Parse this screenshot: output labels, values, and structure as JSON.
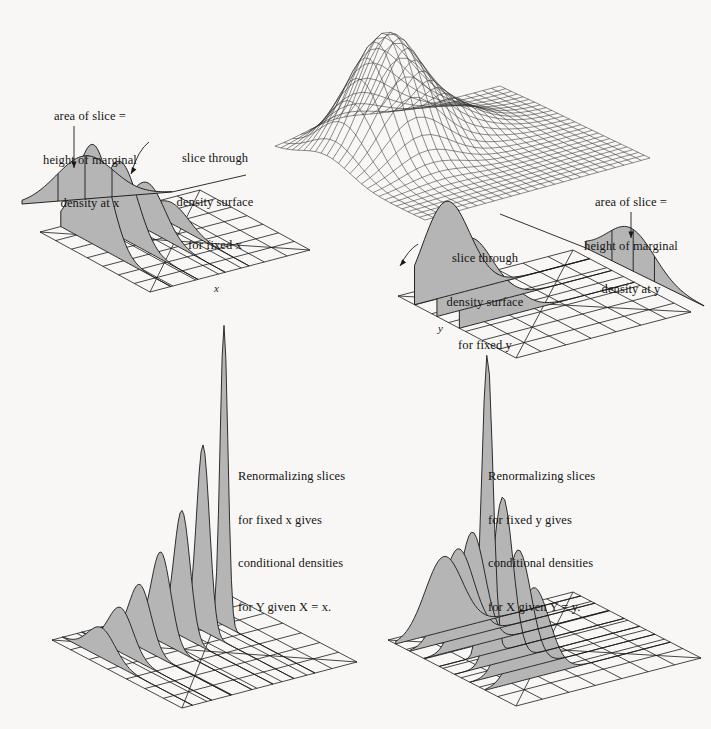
{
  "figure": {
    "background_color": "#f8f7f5",
    "ink_color": "#1a1a1a",
    "slice_fill_color": "#b5b5b5",
    "mesh_color": "#303030"
  },
  "annotations": {
    "top_left_marginal": {
      "line1": "area of slice =",
      "line2": "height of marginal",
      "line3": "density at x"
    },
    "top_left_slice": {
      "line1": "slice through",
      "line2": "density surface",
      "line3": "for fixed x"
    },
    "mid_right_slice": {
      "line1": "slice through",
      "line2": "density surface",
      "line3": "for fixed y"
    },
    "mid_right_marginal": {
      "line1": "area of slice =",
      "line2": "height of marginal",
      "line3": "density at y"
    },
    "bottom_left": {
      "line1": "Renormalizing slices",
      "line2": "for fixed x gives",
      "line3": "conditional densities",
      "line4": "for Y given X = x."
    },
    "bottom_right": {
      "line1": "Renormalizing slices",
      "line2": "for fixed y gives",
      "line3": "conditional densities",
      "line4": "for X given Y = y."
    }
  },
  "axis_labels": {
    "x": "x",
    "y": "y"
  },
  "chart_data": {
    "type": "surface",
    "xlabel": "x",
    "ylabel": "y",
    "grid": true,
    "legend": "none",
    "panels": [
      {
        "id": "top-surface",
        "kind": "wireframe-mesh",
        "description": "Bivariate probability density surface drawn as a wireframe mesh on a flat base plane; single dominant mode in the near-left quadrant decaying to zero at the edges.",
        "mesh_rows": 28,
        "mesh_cols": 28,
        "peak_height_rel": 1.0,
        "peak_location": [
          0.3,
          0.35
        ]
      },
      {
        "id": "top-left-slices",
        "kind": "slices-fixed-x",
        "description": "Density surface cut into slices at fixed x; shaded slice profiles over a 7x7 grid floor, plus an elevated marginal density curve whose area equals the marginal height.",
        "grid_rows": 7,
        "grid_cols": 7,
        "slice_count": 4,
        "slice_peak_heights": [
          0.95,
          0.72,
          0.45,
          0.2
        ],
        "marginal_inset": {
          "tick_count": 3,
          "shape": "unimodal"
        }
      },
      {
        "id": "mid-right-slices",
        "kind": "slices-fixed-y",
        "description": "Density surface cut into slices at fixed y; shaded nested slice profiles over a 7x7 grid floor.",
        "grid_rows": 7,
        "grid_cols": 7,
        "slice_count": 3,
        "slice_peak_heights": [
          0.95,
          0.7,
          0.45
        ],
        "marginal_inset": {
          "tick_count": 3,
          "shape": "unimodal",
          "tilted": true
        }
      },
      {
        "id": "bottom-left-conditionals",
        "kind": "conditional-densities-given-x",
        "description": "Renormalized slices for fixed x: seven conditional density curves of Y given X = x, heights increasing steeply toward the back-right, the last one a very tall narrow spike.",
        "grid_rows": 7,
        "grid_cols": 7,
        "slice_count": 7,
        "slice_peak_heights": [
          0.1,
          0.15,
          0.21,
          0.3,
          0.42,
          0.62,
          1.0
        ]
      },
      {
        "id": "bottom-right-conditionals",
        "kind": "conditional-densities-given-y",
        "description": "Renormalized slices for fixed y: conditional density curves of X given Y = y, all centered on a common tall spike with broad shoulders spreading left and right.",
        "grid_rows": 7,
        "grid_cols": 7,
        "slice_count": 7,
        "slice_peak_heights": [
          0.25,
          0.3,
          0.38,
          1.0,
          0.55,
          0.4,
          0.3
        ]
      }
    ]
  }
}
